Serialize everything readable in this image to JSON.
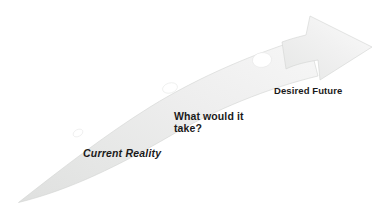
{
  "diagram": {
    "background_color": "#ffffff",
    "arrow": {
      "name": "curved-progress-arrow",
      "direction": "lower-left to upper-right",
      "fill_light": "#f4f4f4",
      "fill_mid": "#e9e9e9",
      "fill_dark": "#d9dad9",
      "edge_color": "#cfd1cf",
      "milestone_color": "#ffffff"
    },
    "milestones": [
      {
        "name": "milestone-1",
        "cx": 78,
        "cy": 133,
        "rx": 5.2,
        "ry": 3.4,
        "rotate": -28
      },
      {
        "name": "milestone-2",
        "cx": 170,
        "cy": 88,
        "rx": 7.6,
        "ry": 5.0,
        "rotate": -16
      },
      {
        "name": "milestone-3",
        "cx": 262,
        "cy": 60,
        "rx": 9.6,
        "ry": 7.4,
        "rotate": -8
      }
    ]
  },
  "labels": {
    "current_reality": "Current Reality",
    "what_would_it_take": "What would it\ntake?",
    "desired_future": "Desired Future"
  }
}
